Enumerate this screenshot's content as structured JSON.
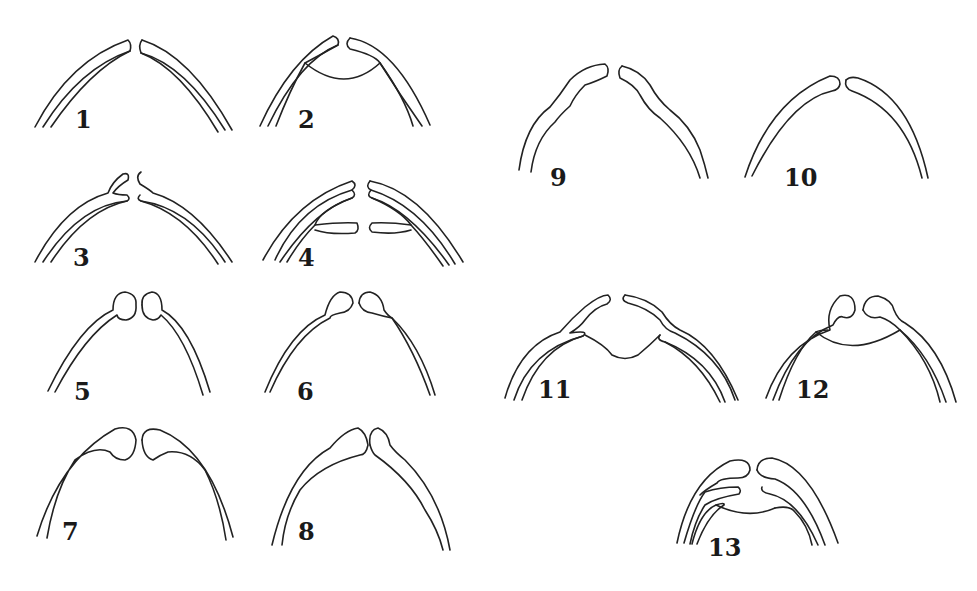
{
  "figure": {
    "background": "#ffffff",
    "line_color": "#222222",
    "panels": [
      {
        "id": 1,
        "label": "1",
        "label_pos": [
          75,
          108
        ],
        "description": "two double-walled arcs separated at apex"
      },
      {
        "id": 2,
        "label": "2",
        "label_pos": [
          298,
          108
        ],
        "description": "double-walled arcs with inner wall split and concave membrane between"
      },
      {
        "id": 3,
        "label": "3",
        "label_pos": [
          73,
          246
        ],
        "description": "double-walled arcs with outer wall forming raised knob at apex"
      },
      {
        "id": 4,
        "label": "4",
        "label_pos": [
          298,
          246
        ],
        "description": "triple-walled arcs with innermost lamina splitting horizontally"
      },
      {
        "id": 5,
        "label": "5",
        "label_pos": [
          74,
          380
        ],
        "description": "single-walled arcs ending in rounded bulb at apex"
      },
      {
        "id": 6,
        "label": "6",
        "label_pos": [
          297,
          380
        ],
        "description": "single-walled arcs ending in tapered teardrop bulb"
      },
      {
        "id": 7,
        "label": "7",
        "label_pos": [
          62,
          520
        ],
        "description": "wide arcs with large flattened knobs meeting at apex"
      },
      {
        "id": 8,
        "label": "8",
        "label_pos": [
          298,
          520
        ],
        "description": "arcs with pointed knobs touching at apex"
      },
      {
        "id": 9,
        "label": "9",
        "label_pos": [
          550,
          166
        ],
        "description": "sinuous arcs with shoulders near apex"
      },
      {
        "id": 10,
        "label": "10",
        "label_pos": [
          784,
          166
        ],
        "description": "smooth arcs with tapering walls"
      },
      {
        "id": 11,
        "label": "11",
        "label_pos": [
          538,
          378
        ],
        "description": "arcs with shoulders and inner lamina plus lower membrane"
      },
      {
        "id": 12,
        "label": "12",
        "label_pos": [
          796,
          378
        ],
        "description": "bulbed arcs with inner lamina and concave membrane"
      },
      {
        "id": 13,
        "label": "13",
        "label_pos": [
          708,
          536
        ],
        "description": "multi-layered arcs with apical knobs, intermediate lamina and membrane"
      }
    ]
  }
}
